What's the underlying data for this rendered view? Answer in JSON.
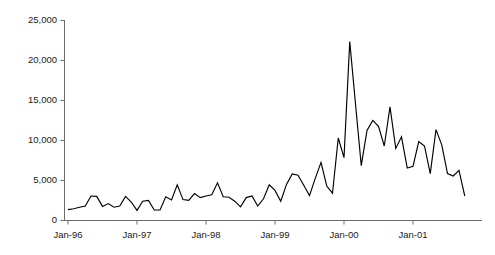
{
  "chart_data": {
    "type": "line",
    "title": "",
    "subtitle": "",
    "xlabel": "",
    "ylabel": "",
    "grid": false,
    "legend": false,
    "legend_position": "none",
    "series_color": "#000000",
    "axis_color": "#6b6b6b",
    "ylim": [
      0,
      25000
    ],
    "ytick_values": [
      0,
      5000,
      10000,
      15000,
      20000,
      25000
    ],
    "ytick_labels": [
      "0",
      "5,000",
      "10,000",
      "15,000",
      "20,000",
      "25,000"
    ],
    "xtick_labels": [
      "Jan-96",
      "Jan-97",
      "Jan-98",
      "Jan-99",
      "Jan-00",
      "Jan-01"
    ],
    "xtick_x": [
      "1996-01",
      "1997-01",
      "1998-01",
      "1999-01",
      "2000-01",
      "2001-01"
    ],
    "xlim": [
      "1996-01",
      "2001-11"
    ],
    "x": [
      "1996-01",
      "1996-02",
      "1996-03",
      "1996-04",
      "1996-05",
      "1996-06",
      "1996-07",
      "1996-08",
      "1996-09",
      "1996-10",
      "1996-11",
      "1996-12",
      "1997-01",
      "1997-02",
      "1997-03",
      "1997-04",
      "1997-05",
      "1997-06",
      "1997-07",
      "1997-08",
      "1997-09",
      "1997-10",
      "1997-11",
      "1997-12",
      "1998-01",
      "1998-02",
      "1998-03",
      "1998-04",
      "1998-05",
      "1998-06",
      "1998-07",
      "1998-08",
      "1998-09",
      "1998-10",
      "1998-11",
      "1998-12",
      "1999-01",
      "1999-02",
      "1999-03",
      "1999-04",
      "1999-05",
      "1999-06",
      "1999-07",
      "1999-08",
      "1999-09",
      "1999-10",
      "1999-11",
      "1999-12",
      "2000-01",
      "2000-02",
      "2000-03",
      "2000-04",
      "2000-05",
      "2000-06",
      "2000-07",
      "2000-08",
      "2000-09",
      "2000-10",
      "2000-11",
      "2000-12",
      "2001-01",
      "2001-02",
      "2001-03",
      "2001-04",
      "2001-05",
      "2001-06",
      "2001-07",
      "2001-08",
      "2001-09",
      "2001-10"
    ],
    "values": [
      1300,
      1400,
      1600,
      1750,
      3000,
      2950,
      1700,
      2050,
      1600,
      1750,
      2950,
      2250,
      1200,
      2350,
      2450,
      1250,
      1250,
      2900,
      2500,
      4400,
      2550,
      2450,
      3300,
      2800,
      3000,
      3150,
      4650,
      2900,
      2850,
      2350,
      1650,
      2800,
      3000,
      1750,
      2650,
      4400,
      3700,
      2350,
      4450,
      5750,
      5600,
      4350,
      3050,
      5200,
      7200,
      4250,
      3350,
      10250,
      7800,
      22300,
      14500,
      6800,
      11200,
      12450,
      11700,
      9250,
      14150,
      8950,
      10400,
      6500,
      6700,
      9800,
      9250,
      5800,
      11300,
      9400,
      5800,
      5500,
      6200,
      3000
    ],
    "peak": {
      "label": "2000-02",
      "value": 22300
    },
    "min": {
      "label": "1997-01",
      "value": 1200
    }
  }
}
